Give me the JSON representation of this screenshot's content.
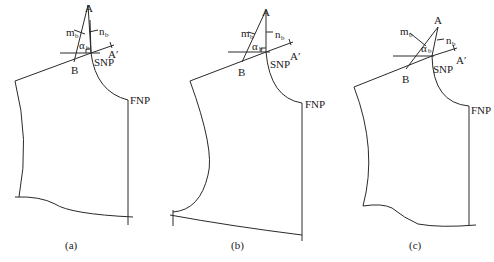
{
  "figure": {
    "panels": [
      {
        "id": "a",
        "caption": "(a)",
        "labels": {
          "A": "A",
          "A_prime": "A′",
          "B": "B",
          "SNP": "SNP",
          "FNP": "FNP",
          "m": "m",
          "m_sub": "b",
          "n": "n",
          "n_sub": "b",
          "alpha": "α",
          "alpha_sub": "b"
        }
      },
      {
        "id": "b",
        "caption": "(b)",
        "labels": {
          "A": "A",
          "A_prime": "A′",
          "B": "B",
          "SNP": "SNP",
          "FNP": "FNP",
          "m": "m",
          "m_sub": "b",
          "n": "n",
          "n_sub": "b",
          "alpha": "α",
          "alpha_sub": "b"
        }
      },
      {
        "id": "c",
        "caption": "(c)",
        "labels": {
          "A": "A",
          "A_prime": "A′",
          "B": "B",
          "SNP": "SNP",
          "FNP": "FNP",
          "m": "m",
          "m_sub": "b",
          "n": "n",
          "n_sub": "b",
          "alpha": "α",
          "alpha_sub": "b"
        }
      }
    ]
  }
}
